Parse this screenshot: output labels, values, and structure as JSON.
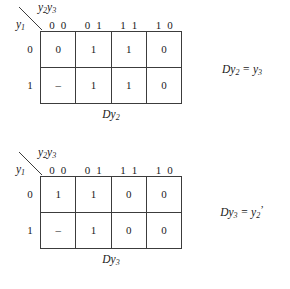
{
  "maps": [
    {
      "id": "Dy2",
      "top_var_main": "y",
      "top_var_sub_a": "2",
      "top_var_main_b": "y",
      "top_var_sub_b": "3",
      "left_var_main": "y",
      "left_var_sub": "1",
      "col_headers": [
        "0 0",
        "0 1",
        "1 1",
        "1 0"
      ],
      "row_headers": [
        "0",
        "1"
      ],
      "rows": [
        [
          "0",
          "1",
          "1",
          "0"
        ],
        [
          "–",
          "1",
          "1",
          "0"
        ]
      ],
      "caption_main": "D",
      "caption_var": "y",
      "caption_sub": "2",
      "equation": {
        "lhs_d": "D",
        "lhs_var": "y",
        "lhs_sub": "2",
        "eq": "=",
        "rhs_var": "y",
        "rhs_sub": "3",
        "rhs_prime": "",
        "plain": "Dy2 = y3"
      }
    },
    {
      "id": "Dy3",
      "top_var_main": "y",
      "top_var_sub_a": "2",
      "top_var_main_b": "y",
      "top_var_sub_b": "3",
      "left_var_main": "y",
      "left_var_sub": "1",
      "col_headers": [
        "0 0",
        "0 1",
        "1 1",
        "1 0"
      ],
      "row_headers": [
        "0",
        "1"
      ],
      "rows": [
        [
          "1",
          "1",
          "0",
          "0"
        ],
        [
          "–",
          "1",
          "0",
          "0"
        ]
      ],
      "caption_main": "D",
      "caption_var": "y",
      "caption_sub": "3",
      "equation": {
        "lhs_d": "D",
        "lhs_var": "y",
        "lhs_sub": "3",
        "eq": "=",
        "rhs_var": "y",
        "rhs_sub": "2",
        "rhs_prime": "’",
        "plain": "Dy3 = y2'"
      }
    }
  ],
  "colors": {
    "line": "#3c3c3c",
    "text": "#1a1a1a",
    "background": "#ffffff"
  }
}
